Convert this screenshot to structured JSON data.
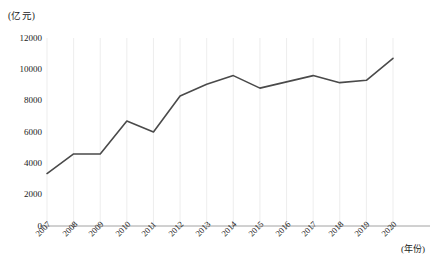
{
  "chart_data": {
    "type": "line",
    "title": "",
    "subtitle": "",
    "xlabel": "(年份)",
    "ylabel": "(亿元)",
    "unit_note": "(亿元)",
    "categories": [
      "2007",
      "2008",
      "2009",
      "2010",
      "2011",
      "2012",
      "2013",
      "2014",
      "2015",
      "2016",
      "2017",
      "2018",
      "2019",
      "2020"
    ],
    "values": [
      3350,
      4600,
      4600,
      6700,
      6000,
      8300,
      9050,
      9600,
      8800,
      9200,
      9600,
      9150,
      9300,
      10700
    ],
    "series": [
      {
        "name": "",
        "values": [
          3350,
          4600,
          4600,
          6700,
          6000,
          8300,
          9050,
          9600,
          8800,
          9200,
          9600,
          9150,
          9300,
          10700
        ]
      }
    ],
    "ylim": [
      0,
      12000
    ],
    "y_ticks": [
      0,
      2000,
      4000,
      6000,
      8000,
      10000,
      12000
    ],
    "y_tick_labels": [
      "0",
      "2000",
      "4000",
      "6000",
      "8000",
      "10000",
      "12000"
    ],
    "x_tick_labels": [
      "2007",
      "2008",
      "2009",
      "2010",
      "2011",
      "2012",
      "2013",
      "2014",
      "2015",
      "2016",
      "2017",
      "2018",
      "2019",
      "2020"
    ],
    "grid": "vertical-only",
    "legend": "none",
    "legend_position": "none",
    "line_color": "#4a4a4a",
    "gridline_color": "#e8e8e8",
    "axis_color": "#8a8a8a",
    "background_color": "#ffffff"
  }
}
